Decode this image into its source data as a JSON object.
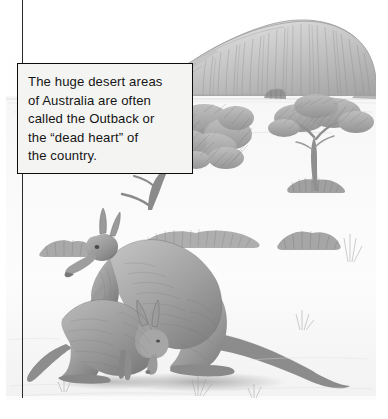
{
  "page": {
    "background_color": "#ffffff",
    "width": 388,
    "height": 419,
    "media_type": "pencil-illustration"
  },
  "illustration": {
    "title": "Australian outback landscape with Uluru and kangaroos",
    "style": "graphite pencil drawing, grayscale",
    "palette": {
      "paper": "#ffffff",
      "sky": "#fdfdfd",
      "rock_light": "#dcdcdc",
      "rock_mid": "#b4b4b4",
      "rock_dark": "#8d8d8d",
      "foliage_light": "#c9c9c9",
      "foliage_dark": "#7c7c7c",
      "ground": "#efefef",
      "ground_shadow": "#cfcfcf",
      "animal_light": "#c6c6c6",
      "animal_mid": "#9d9d9d",
      "animal_dark": "#6f6f6f",
      "ink": "#2a2a2a"
    },
    "elements": [
      {
        "name": "uluru-rock",
        "label": "large sandstone monolith on horizon"
      },
      {
        "name": "horizon-line",
        "label": "desert horizon"
      },
      {
        "name": "acacia-tree-left",
        "label": "acacia tree at left of scene"
      },
      {
        "name": "acacia-tree-right",
        "label": "acacia tree at right of scene"
      },
      {
        "name": "distant-shrub",
        "label": "small distant shrub near rock base"
      },
      {
        "name": "shrub-cluster",
        "label": "scrub bushes along middle ground"
      },
      {
        "name": "spinifex-grass",
        "label": "tufts of desert grass"
      },
      {
        "name": "kangaroo-adult",
        "label": "adult kangaroo standing upright"
      },
      {
        "name": "kangaroo-joey",
        "label": "smaller kangaroo grazing in foreground"
      },
      {
        "name": "ground-shadow",
        "label": "cast shadows on sand"
      }
    ]
  },
  "callout": {
    "text": "The huge desert areas\nof Australia are often\ncalled the Outback or\nthe “dead heart” of\nthe country.",
    "lines": [
      "The huge desert areas",
      "of Australia are often",
      "called the Outback or",
      "the “dead heart” of",
      "the country."
    ],
    "background_color": "#f4f4f2",
    "border_color": "#0d0d0d",
    "text_color": "#151515"
  },
  "rule": {
    "name": "vertical-rule",
    "color": "#2a2a2a"
  }
}
